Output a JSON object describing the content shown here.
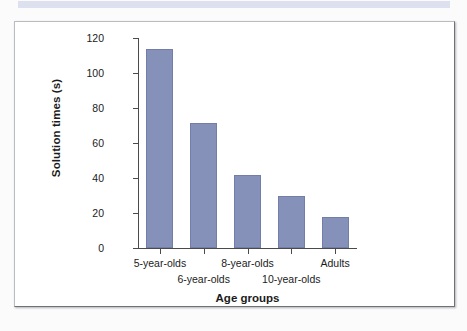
{
  "banner": {
    "color": "#dde0ee"
  },
  "figure": {
    "frame_color": "#b9bcc2",
    "background": "#ffffff"
  },
  "chart_data": {
    "type": "bar",
    "title": "",
    "subtitle": "",
    "xlabel": "Age groups",
    "ylabel": "Solution times (s)",
    "categories": [
      "5-year-olds",
      "6-year-olds",
      "8-year-olds",
      "10-year-olds",
      "Adults"
    ],
    "values": [
      113.5,
      71.5,
      42,
      29.5,
      17.5
    ],
    "ylim": [
      0,
      120
    ],
    "yticks": [
      0,
      20,
      40,
      60,
      80,
      100,
      120
    ],
    "ytick_labels": [
      "0",
      "20",
      "40",
      "60",
      "80",
      "100",
      "120"
    ],
    "grid": false,
    "legend": false,
    "legend_position": "none",
    "bar_color": "#8591b8",
    "bar_edge_color": "#727ea8",
    "label_rows": [
      0,
      1,
      0,
      1,
      0
    ],
    "annotations": []
  }
}
